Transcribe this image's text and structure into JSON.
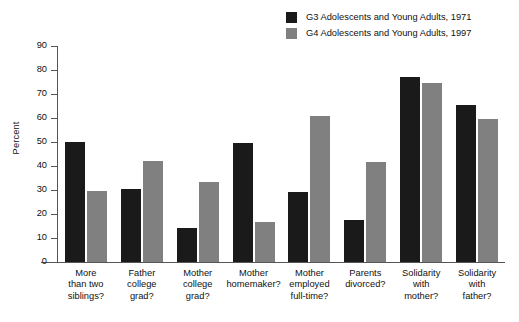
{
  "chart_data": {
    "type": "bar",
    "title": "",
    "subtitle": "",
    "xlabel": "",
    "ylabel": "Percent",
    "ylim": [
      0,
      90
    ],
    "yticks": [
      0,
      10,
      20,
      30,
      40,
      50,
      60,
      70,
      80,
      90
    ],
    "grid": false,
    "legend_position": "top-right",
    "categories": [
      [
        "More",
        "than two",
        "siblings?"
      ],
      [
        "Father",
        "college",
        "grad?"
      ],
      [
        "Mother",
        "college",
        "grad?"
      ],
      [
        "Mother",
        "homemaker?"
      ],
      [
        "Mother",
        "employed",
        "full-time?"
      ],
      [
        "Parents",
        "divorced?"
      ],
      [
        "Solidarity",
        "with",
        "mother?"
      ],
      [
        "Solidarity",
        "with",
        "father?"
      ]
    ],
    "category_names": [
      "More than two siblings?",
      "Father college grad?",
      "Mother college grad?",
      "Mother homemaker?",
      "Mother employed full-time?",
      "Parents divorced?",
      "Solidarity with mother?",
      "Solidarity with father?"
    ],
    "series": [
      {
        "name": "G3 Adolescents and Young Adults, 1971",
        "color": "#1a1a1a",
        "values": [
          50,
          30.5,
          14,
          49.5,
          29,
          17.5,
          77,
          65.5
        ]
      },
      {
        "name": "G4 Adolescents and Young Adults, 1997",
        "color": "#808080",
        "values": [
          29.5,
          42,
          33.5,
          16.5,
          61,
          41.5,
          74.5,
          59.5
        ]
      }
    ]
  },
  "legend": {
    "items": [
      {
        "label": "G3 Adolescents and Young Adults, 1971",
        "color": "#1a1a1a"
      },
      {
        "label": "G4 Adolescents and Young Adults, 1997",
        "color": "#808080"
      }
    ]
  },
  "axis": {
    "y_title": "Percent",
    "y_ticks": [
      "0",
      "10",
      "20",
      "30",
      "40",
      "50",
      "60",
      "70",
      "80",
      "90"
    ]
  }
}
